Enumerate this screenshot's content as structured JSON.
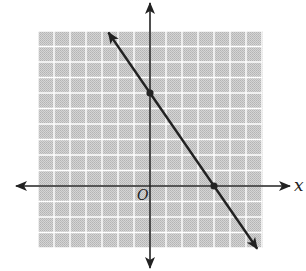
{
  "chart_data": {
    "type": "line",
    "title": "",
    "xlabel": "x",
    "ylabel": "",
    "origin_label": "O",
    "xlim": [
      -7,
      7
    ],
    "ylim": [
      -4,
      10
    ],
    "grid": true,
    "tick_labels": false,
    "series": [
      {
        "name": "line",
        "equation": "y = -1.5x + 6",
        "slope": -1.5,
        "intercept": 6,
        "x": [
          -2.6,
          0,
          4,
          6.7
        ],
        "y": [
          9.9,
          6,
          0,
          -4.05
        ],
        "marked_points": [
          {
            "label": "y-intercept",
            "x": 0,
            "y": 6
          },
          {
            "label": "x-intercept",
            "x": 4,
            "y": 0
          }
        ],
        "arrows_both_ends": true
      }
    ]
  },
  "labels": {
    "x_axis": "x",
    "origin": "O"
  },
  "colors": {
    "grid_fill": "#c8c8c8",
    "grid_lines": "#ffffff",
    "axis": "#222222",
    "line": "#222222"
  }
}
